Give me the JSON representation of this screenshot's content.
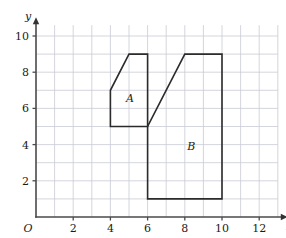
{
  "figure": {
    "background_color": "#ffffff",
    "grid_color": "#c9ccd4",
    "axis_color": "#4a4a4a",
    "shape_stroke_color": "#2b2b2b"
  },
  "axes": {
    "x_name": "x",
    "y_name": "y",
    "origin_label": "O",
    "x_ticks": [
      {
        "value": 2,
        "label": "2"
      },
      {
        "value": 4,
        "label": "4"
      },
      {
        "value": 6,
        "label": "6"
      },
      {
        "value": 8,
        "label": "8"
      },
      {
        "value": 10,
        "label": "10"
      },
      {
        "value": 12,
        "label": "12"
      }
    ],
    "y_ticks": [
      {
        "value": 2,
        "label": "2"
      },
      {
        "value": 4,
        "label": "4"
      },
      {
        "value": 6,
        "label": "6"
      },
      {
        "value": 8,
        "label": "8"
      },
      {
        "value": 10,
        "label": "10"
      }
    ],
    "x_range": [
      0,
      13
    ],
    "y_range": [
      0,
      10.6
    ],
    "grid_spacing": 1
  },
  "chart_data": {
    "type": "scatter",
    "title": "",
    "xlabel": "x",
    "ylabel": "y",
    "xlim": [
      0,
      13
    ],
    "ylim": [
      0,
      10.6
    ],
    "grid": true,
    "legend": "none",
    "shapes": [
      {
        "name": "A",
        "label": "A",
        "label_position": {
          "x": 5.05,
          "y": 6.55
        },
        "vertices": [
          [
            4,
            5
          ],
          [
            4,
            7
          ],
          [
            5,
            9
          ],
          [
            6,
            9
          ],
          [
            6,
            5
          ]
        ],
        "closed": true
      },
      {
        "name": "B",
        "label": "B",
        "label_position": {
          "x": 8.35,
          "y": 3.9
        },
        "vertices": [
          [
            6,
            1
          ],
          [
            6,
            5
          ],
          [
            8,
            9
          ],
          [
            10,
            9
          ],
          [
            10,
            1
          ]
        ],
        "closed": true
      }
    ]
  }
}
